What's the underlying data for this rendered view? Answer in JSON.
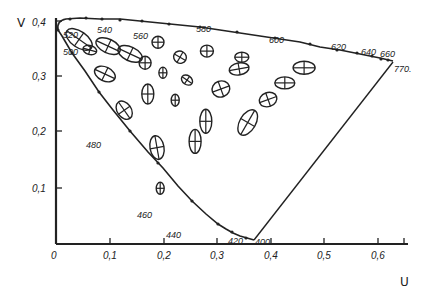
{
  "chart_data": {
    "type": "scatter",
    "title": "",
    "xlabel": "U",
    "ylabel": "V",
    "xlim": [
      0,
      0.65
    ],
    "ylim": [
      0,
      0.4
    ],
    "grid": false,
    "x_ticks": [
      "0",
      "0,1",
      "0,2",
      "0,3",
      "0,4",
      "0,5",
      "0,6"
    ],
    "y_ticks": [
      "0,1",
      "0,2",
      "0,3",
      "0,4"
    ],
    "spectral_locus": {
      "description": "Spectrum locus in CIE 1960 UCS (u,v) with wavelength labels in nm, closed by purple line from 400 to 770",
      "points": [
        {
          "wl": 400,
          "u": 0.257,
          "v": 0.01
        },
        {
          "wl": 420,
          "u": 0.24,
          "v": 0.015
        },
        {
          "wl": 440,
          "u": 0.218,
          "v": 0.03
        },
        {
          "wl": 460,
          "u": 0.175,
          "v": 0.063
        },
        {
          "wl": 480,
          "u": 0.09,
          "v": 0.18
        },
        {
          "wl": 500,
          "u": 0.005,
          "v": 0.345
        },
        {
          "wl": 520,
          "u": 0.012,
          "v": 0.378
        },
        {
          "wl": 540,
          "u": 0.07,
          "v": 0.388
        },
        {
          "wl": 560,
          "u": 0.138,
          "v": 0.384
        },
        {
          "wl": 580,
          "u": 0.235,
          "v": 0.372
        },
        {
          "wl": 600,
          "u": 0.37,
          "v": 0.355
        },
        {
          "wl": 620,
          "u": 0.485,
          "v": 0.345
        },
        {
          "wl": 640,
          "u": 0.555,
          "v": 0.338
        },
        {
          "wl": 660,
          "u": 0.588,
          "v": 0.334
        },
        {
          "wl": 770,
          "u": 0.628,
          "v": 0.33
        }
      ],
      "labels": [
        "400",
        "420",
        "440",
        "460",
        "480",
        "500",
        "520",
        "540",
        "560",
        "580",
        "600",
        "620",
        "640",
        "660",
        "770"
      ]
    },
    "ellipses": {
      "description": "MacAdam-style discrimination ellipses (enlarged) with cross-hair axes",
      "count": 25,
      "items": [
        {
          "u": 0.043,
          "v": 0.367,
          "rx": 15,
          "ry": 8,
          "rot": 35
        },
        {
          "u": 0.063,
          "v": 0.348,
          "rx": 7,
          "ry": 4.5,
          "rot": 15
        },
        {
          "u": 0.097,
          "v": 0.355,
          "rx": 13,
          "ry": 7,
          "rot": 25
        },
        {
          "u": 0.138,
          "v": 0.341,
          "rx": 13,
          "ry": 7,
          "rot": 25
        },
        {
          "u": 0.19,
          "v": 0.362,
          "rx": 6,
          "ry": 6,
          "rot": 0
        },
        {
          "u": 0.166,
          "v": 0.325,
          "rx": 6,
          "ry": 6.5,
          "rot": 0
        },
        {
          "u": 0.091,
          "v": 0.305,
          "rx": 11,
          "ry": 7,
          "rot": 25
        },
        {
          "u": 0.199,
          "v": 0.307,
          "rx": 4,
          "ry": 5.5,
          "rot": 0
        },
        {
          "u": 0.231,
          "v": 0.335,
          "rx": 6.5,
          "ry": 6,
          "rot": 30
        },
        {
          "u": 0.244,
          "v": 0.294,
          "rx": 6,
          "ry": 4.5,
          "rot": 35
        },
        {
          "u": 0.281,
          "v": 0.346,
          "rx": 6.5,
          "ry": 6,
          "rot": 0
        },
        {
          "u": 0.171,
          "v": 0.269,
          "rx": 6,
          "ry": 10,
          "rot": 0
        },
        {
          "u": 0.222,
          "v": 0.258,
          "rx": 4,
          "ry": 6,
          "rot": 0
        },
        {
          "u": 0.127,
          "v": 0.24,
          "rx": 7,
          "ry": 10,
          "rot": -35
        },
        {
          "u": 0.279,
          "v": 0.22,
          "rx": 6,
          "ry": 12,
          "rot": 0
        },
        {
          "u": 0.259,
          "v": 0.184,
          "rx": 6,
          "ry": 12,
          "rot": 0
        },
        {
          "u": 0.188,
          "v": 0.173,
          "rx": 7,
          "ry": 12,
          "rot": -10
        },
        {
          "u": 0.194,
          "v": 0.1,
          "rx": 4,
          "ry": 6,
          "rot": 0
        },
        {
          "u": 0.346,
          "v": 0.335,
          "rx": 7,
          "ry": 5,
          "rot": 0
        },
        {
          "u": 0.341,
          "v": 0.314,
          "rx": 10,
          "ry": 6,
          "rot": -10
        },
        {
          "u": 0.307,
          "v": 0.278,
          "rx": 9,
          "ry": 8,
          "rot": -20
        },
        {
          "u": 0.357,
          "v": 0.218,
          "rx": 8,
          "ry": 14,
          "rot": 30
        },
        {
          "u": 0.395,
          "v": 0.259,
          "rx": 9,
          "ry": 7,
          "rot": -20
        },
        {
          "u": 0.426,
          "v": 0.289,
          "rx": 10,
          "ry": 6,
          "rot": 0
        },
        {
          "u": 0.462,
          "v": 0.316,
          "rx": 11,
          "ry": 6.5,
          "rot": 0
        }
      ]
    }
  },
  "axes": {
    "x_name": "U",
    "y_name": "V",
    "origin_label": "0",
    "x_tick_labels": [
      "0,1",
      "0,2",
      "0,3",
      "0,4",
      "0,5",
      "0,6"
    ],
    "y_tick_labels": [
      "0,1",
      "0,2",
      "0,3",
      "0,4"
    ]
  },
  "wavelength_labels": {
    "w400": "400",
    "w420": "420",
    "w440": "440",
    "w460": "460",
    "w480": "480",
    "w500": "500",
    "w520": "520",
    "w540": "540",
    "w560": "560",
    "w580": "580",
    "w600": "600",
    "w620": "620",
    "w640": "640",
    "w660": "660",
    "w770": "770."
  },
  "colors": {
    "ink": "#222222",
    "background": "#ffffff"
  }
}
